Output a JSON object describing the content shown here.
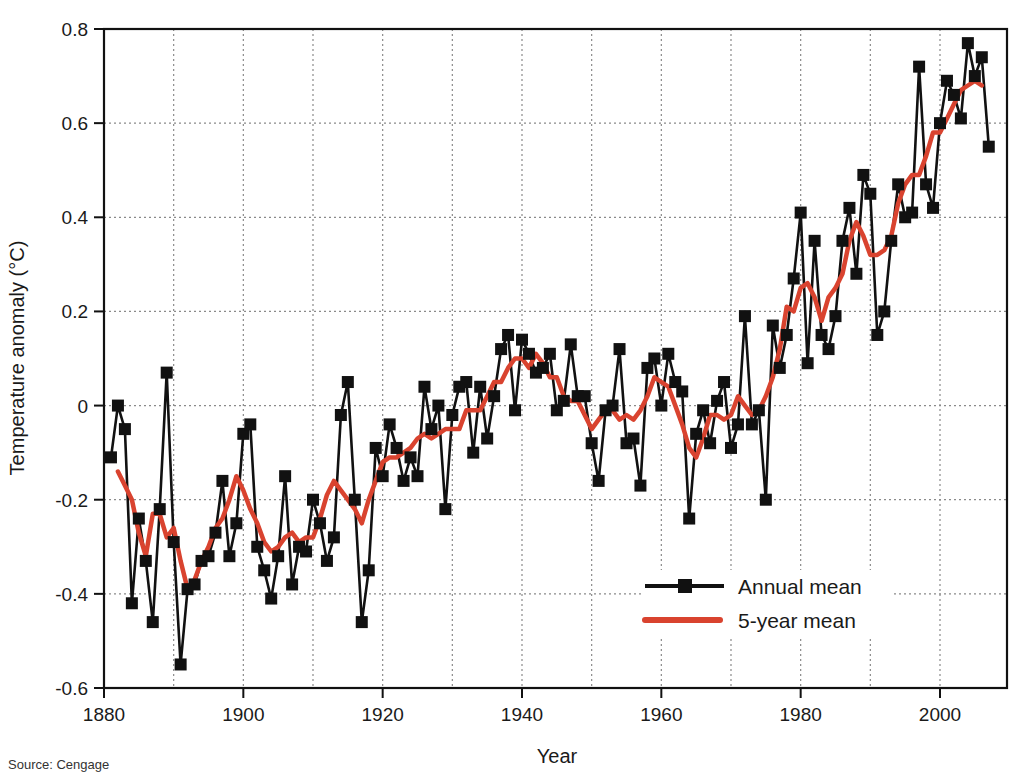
{
  "source_note": "Source: Cengage",
  "colors": {
    "annual": "#111111",
    "five_year": "#d9432f",
    "grid": "#8a8a8a",
    "axis": "#111111"
  },
  "chart_data": {
    "type": "line",
    "title": "",
    "xlabel": "Year",
    "ylabel": "Temperature anomaly (°C)",
    "xlim": [
      1880,
      2010
    ],
    "ylim": [
      -0.6,
      0.8
    ],
    "x_ticks": [
      1880,
      1900,
      1920,
      1940,
      1960,
      1980,
      2000
    ],
    "x_tick_labels": [
      "1880",
      "1900",
      "1920",
      "1940",
      "1960",
      "1980",
      "2000"
    ],
    "x_minor_grid": [
      1890,
      1900,
      1910,
      1920,
      1930,
      1940,
      1950,
      1960,
      1970,
      1980,
      1990,
      2000
    ],
    "y_ticks": [
      -0.6,
      -0.4,
      -0.2,
      0,
      0.2,
      0.4,
      0.6,
      0.8
    ],
    "y_tick_labels": [
      "-0.6",
      "-0.4",
      "-0.2",
      "0",
      "0.2",
      "0.4",
      "0.6",
      "0.8"
    ],
    "grid": true,
    "grid_style": "dotted",
    "legend_position": "lower right",
    "legend": [
      "Annual mean",
      "5-year mean"
    ],
    "series": [
      {
        "name": "Annual mean",
        "marker": "square",
        "x": [
          1881,
          1882,
          1883,
          1884,
          1885,
          1886,
          1887,
          1888,
          1889,
          1890,
          1891,
          1892,
          1893,
          1894,
          1895,
          1896,
          1897,
          1898,
          1899,
          1900,
          1901,
          1902,
          1903,
          1904,
          1905,
          1906,
          1907,
          1908,
          1909,
          1910,
          1911,
          1912,
          1913,
          1914,
          1915,
          1916,
          1917,
          1918,
          1919,
          1920,
          1921,
          1922,
          1923,
          1924,
          1925,
          1926,
          1927,
          1928,
          1929,
          1930,
          1931,
          1932,
          1933,
          1934,
          1935,
          1936,
          1937,
          1938,
          1939,
          1940,
          1941,
          1942,
          1943,
          1944,
          1945,
          1946,
          1947,
          1948,
          1949,
          1950,
          1951,
          1952,
          1953,
          1954,
          1955,
          1956,
          1957,
          1958,
          1959,
          1960,
          1961,
          1962,
          1963,
          1964,
          1965,
          1966,
          1967,
          1968,
          1969,
          1970,
          1971,
          1972,
          1973,
          1974,
          1975,
          1976,
          1977,
          1978,
          1979,
          1980,
          1981,
          1982,
          1983,
          1984,
          1985,
          1986,
          1987,
          1988,
          1989,
          1990,
          1991,
          1992,
          1993,
          1994,
          1995,
          1996,
          1997,
          1998,
          1999,
          2000,
          2001,
          2002,
          2003,
          2004,
          2005,
          2006,
          2007
        ],
        "values": [
          -0.11,
          0.0,
          -0.05,
          -0.42,
          -0.24,
          -0.33,
          -0.46,
          -0.22,
          0.07,
          -0.29,
          -0.55,
          -0.39,
          -0.38,
          -0.33,
          -0.32,
          -0.27,
          -0.16,
          -0.32,
          -0.25,
          -0.06,
          -0.04,
          -0.3,
          -0.35,
          -0.41,
          -0.32,
          -0.15,
          -0.38,
          -0.3,
          -0.31,
          -0.2,
          -0.25,
          -0.33,
          -0.28,
          -0.02,
          0.05,
          -0.2,
          -0.46,
          -0.35,
          -0.09,
          -0.15,
          -0.04,
          -0.09,
          -0.16,
          -0.11,
          -0.15,
          0.04,
          -0.05,
          0.0,
          -0.22,
          -0.02,
          0.04,
          0.05,
          -0.1,
          0.04,
          -0.07,
          0.02,
          0.12,
          0.15,
          -0.01,
          0.14,
          0.11,
          0.07,
          0.08,
          0.11,
          -0.01,
          0.01,
          0.13,
          0.02,
          0.02,
          -0.08,
          -0.16,
          -0.01,
          0.0,
          0.12,
          -0.08,
          -0.07,
          -0.17,
          0.08,
          0.1,
          0.0,
          0.11,
          0.05,
          0.03,
          -0.24,
          -0.06,
          -0.01,
          -0.08,
          0.01,
          0.05,
          -0.09,
          -0.04,
          0.19,
          -0.04,
          -0.01,
          -0.2,
          0.17,
          0.08,
          0.15,
          0.27,
          0.41,
          0.09,
          0.35,
          0.15,
          0.12,
          0.19,
          0.35,
          0.42,
          0.28,
          0.49,
          0.45,
          0.15,
          0.2,
          0.35,
          0.47,
          0.4,
          0.41,
          0.72,
          0.47,
          0.42,
          0.6,
          0.69,
          0.66,
          0.61,
          0.77,
          0.7,
          0.74,
          0.55
        ]
      },
      {
        "name": "5-year mean",
        "marker": "none",
        "x": [
          1882,
          1883,
          1884,
          1885,
          1886,
          1887,
          1888,
          1889,
          1890,
          1891,
          1892,
          1893,
          1894,
          1895,
          1896,
          1897,
          1898,
          1899,
          1900,
          1901,
          1902,
          1903,
          1904,
          1905,
          1906,
          1907,
          1908,
          1909,
          1910,
          1911,
          1912,
          1913,
          1914,
          1915,
          1916,
          1917,
          1918,
          1919,
          1920,
          1921,
          1922,
          1923,
          1924,
          1925,
          1926,
          1927,
          1928,
          1929,
          1930,
          1931,
          1932,
          1933,
          1934,
          1935,
          1936,
          1937,
          1938,
          1939,
          1940,
          1941,
          1942,
          1943,
          1944,
          1945,
          1946,
          1947,
          1948,
          1949,
          1950,
          1951,
          1952,
          1953,
          1954,
          1955,
          1956,
          1957,
          1958,
          1959,
          1960,
          1961,
          1962,
          1963,
          1964,
          1965,
          1966,
          1967,
          1968,
          1969,
          1970,
          1971,
          1972,
          1973,
          1974,
          1975,
          1976,
          1977,
          1978,
          1979,
          1980,
          1981,
          1982,
          1983,
          1984,
          1985,
          1986,
          1987,
          1988,
          1989,
          1990,
          1991,
          1992,
          1993,
          1994,
          1995,
          1996,
          1997,
          1998,
          1999,
          2000,
          2001,
          2002,
          2003,
          2004,
          2005,
          2006
        ],
        "values": [
          -0.14,
          -0.17,
          -0.2,
          -0.27,
          -0.32,
          -0.23,
          -0.23,
          -0.28,
          -0.26,
          -0.33,
          -0.39,
          -0.37,
          -0.33,
          -0.3,
          -0.26,
          -0.24,
          -0.2,
          -0.15,
          -0.18,
          -0.22,
          -0.25,
          -0.29,
          -0.31,
          -0.3,
          -0.28,
          -0.27,
          -0.29,
          -0.28,
          -0.28,
          -0.24,
          -0.19,
          -0.16,
          -0.18,
          -0.2,
          -0.22,
          -0.25,
          -0.2,
          -0.16,
          -0.12,
          -0.11,
          -0.11,
          -0.1,
          -0.09,
          -0.07,
          -0.06,
          -0.07,
          -0.06,
          -0.05,
          -0.05,
          -0.05,
          -0.01,
          -0.01,
          -0.01,
          0.02,
          0.05,
          0.05,
          0.08,
          0.1,
          0.1,
          0.08,
          0.11,
          0.09,
          0.06,
          0.06,
          0.02,
          0.01,
          0.01,
          -0.02,
          -0.05,
          -0.03,
          -0.01,
          -0.01,
          -0.03,
          -0.02,
          -0.03,
          -0.01,
          0.02,
          0.06,
          0.05,
          0.04,
          0.0,
          -0.04,
          -0.09,
          -0.11,
          -0.07,
          -0.02,
          -0.02,
          -0.03,
          -0.02,
          0.02,
          0.0,
          -0.02,
          -0.01,
          0.02,
          0.06,
          0.12,
          0.21,
          0.2,
          0.25,
          0.26,
          0.23,
          0.18,
          0.23,
          0.25,
          0.28,
          0.35,
          0.39,
          0.36,
          0.32,
          0.32,
          0.33,
          0.36,
          0.43,
          0.47,
          0.49,
          0.49,
          0.53,
          0.58,
          0.58,
          0.61,
          0.64,
          0.67,
          0.68,
          0.69,
          0.68
        ]
      }
    ]
  }
}
